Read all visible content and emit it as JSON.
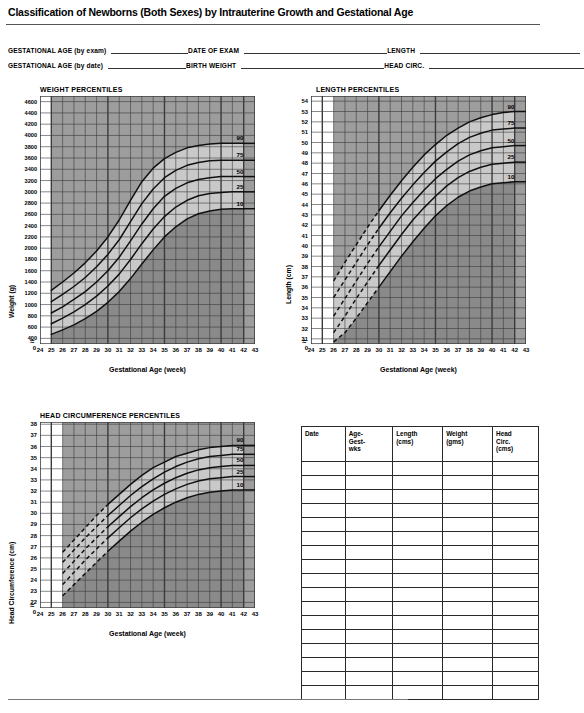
{
  "document": {
    "title": "Classification of Newborns (Both Sexes) by Intrauterine Growth and Gestational Age",
    "footnote": ""
  },
  "fields": [
    {
      "label": "GESTATIONAL AGE (by exam)",
      "value": "",
      "line_width": 78
    },
    {
      "label": "DATE OF EXAM",
      "value": "",
      "line_width": 143
    },
    {
      "label": "LENGTH",
      "value": "",
      "line_width": 160
    },
    {
      "label": "GESTATIONAL AGE (by date)",
      "value": "",
      "line_width": 78
    },
    {
      "label": "BIRTH WEIGHT",
      "value": "",
      "line_width": 143
    },
    {
      "label": "HEAD CIRC.",
      "value": "",
      "line_width": 160
    }
  ],
  "chart_data": [
    {
      "id": "weight",
      "type": "line",
      "title": "WEIGHT PERCENTILES",
      "xlabel": "Gestational Age (week)",
      "ylabel": "Weight (g)",
      "xlim": [
        24,
        43
      ],
      "ylim": [
        300,
        4700
      ],
      "yticks": [
        400,
        600,
        800,
        1000,
        1200,
        1400,
        1600,
        1800,
        2000,
        2200,
        2400,
        2600,
        2800,
        3000,
        3200,
        3400,
        3600,
        3800,
        4000,
        4200,
        4400,
        4600
      ],
      "xticks": [
        24,
        25,
        26,
        27,
        28,
        29,
        30,
        31,
        32,
        33,
        34,
        35,
        36,
        37,
        38,
        39,
        40,
        41,
        42,
        43
      ],
      "axis_break_label": "0",
      "grid": true,
      "x": [
        25,
        26,
        27,
        28,
        29,
        30,
        31,
        32,
        33,
        34,
        35,
        36,
        37,
        38,
        39,
        40,
        41,
        42
      ],
      "series": [
        {
          "name": "90",
          "label": "90",
          "values": [
            1250,
            1400,
            1560,
            1740,
            1950,
            2200,
            2500,
            2850,
            3180,
            3420,
            3590,
            3700,
            3780,
            3820,
            3850,
            3860,
            3860,
            3860
          ]
        },
        {
          "name": "75",
          "label": "75",
          "values": [
            1050,
            1180,
            1320,
            1480,
            1670,
            1890,
            2150,
            2470,
            2790,
            3050,
            3250,
            3380,
            3470,
            3520,
            3550,
            3560,
            3560,
            3560
          ]
        },
        {
          "name": "50",
          "label": "50",
          "values": [
            850,
            960,
            1090,
            1230,
            1400,
            1600,
            1840,
            2130,
            2430,
            2700,
            2920,
            3060,
            3160,
            3220,
            3250,
            3270,
            3270,
            3270
          ]
        },
        {
          "name": "25",
          "label": "25",
          "values": [
            660,
            760,
            870,
            1000,
            1150,
            1330,
            1540,
            1800,
            2080,
            2340,
            2560,
            2730,
            2850,
            2930,
            2970,
            2990,
            3000,
            3000
          ]
        },
        {
          "name": "10",
          "label": "10",
          "values": [
            470,
            550,
            640,
            750,
            880,
            1040,
            1230,
            1460,
            1720,
            1970,
            2200,
            2380,
            2520,
            2610,
            2660,
            2690,
            2700,
            2700
          ]
        }
      ]
    },
    {
      "id": "length",
      "type": "line",
      "title": "LENGTH PERCENTILES",
      "xlabel": "Gestational Age (week)",
      "ylabel": "Length (cm)",
      "xlim": [
        24,
        43
      ],
      "ylim": [
        30.5,
        54.5
      ],
      "yticks": [
        31,
        32,
        33,
        34,
        35,
        36,
        37,
        38,
        39,
        40,
        41,
        42,
        43,
        44,
        45,
        46,
        47,
        48,
        49,
        50,
        51,
        52,
        53,
        54
      ],
      "xticks": [
        24,
        25,
        26,
        27,
        28,
        29,
        30,
        31,
        32,
        33,
        34,
        35,
        36,
        37,
        38,
        39,
        40,
        41,
        42,
        43
      ],
      "axis_break_label": "0",
      "grid": true,
      "x": [
        26,
        27,
        28,
        29,
        30,
        31,
        32,
        33,
        34,
        35,
        36,
        37,
        38,
        39,
        40,
        41,
        42
      ],
      "series": [
        {
          "name": "90",
          "label": "90",
          "values": [
            36.6,
            38.4,
            40.1,
            41.8,
            43.4,
            44.9,
            46.3,
            47.6,
            48.8,
            49.8,
            50.7,
            51.4,
            52.0,
            52.4,
            52.7,
            52.9,
            53.0
          ]
        },
        {
          "name": "75",
          "label": "75",
          "values": [
            35.0,
            36.7,
            38.4,
            40.1,
            41.7,
            43.2,
            44.6,
            45.9,
            47.1,
            48.2,
            49.1,
            49.9,
            50.5,
            50.9,
            51.2,
            51.3,
            51.4
          ]
        },
        {
          "name": "50",
          "label": "50",
          "values": [
            33.2,
            34.9,
            36.6,
            38.3,
            39.9,
            41.4,
            42.9,
            44.2,
            45.4,
            46.5,
            47.4,
            48.2,
            48.8,
            49.2,
            49.5,
            49.6,
            49.7
          ]
        },
        {
          "name": "25",
          "label": "25",
          "values": [
            31.6,
            33.2,
            34.9,
            36.5,
            38.1,
            39.6,
            41.1,
            42.5,
            43.7,
            44.8,
            45.8,
            46.6,
            47.2,
            47.6,
            47.9,
            48.0,
            48.1
          ]
        },
        {
          "name": "10",
          "label": "10",
          "values": [
            30.7,
            31.6,
            33.0,
            34.5,
            36.0,
            37.5,
            39.0,
            40.4,
            41.7,
            42.9,
            43.9,
            44.7,
            45.3,
            45.7,
            46.0,
            46.1,
            46.2
          ]
        }
      ],
      "dashed_start_index": 4
    },
    {
      "id": "head",
      "type": "line",
      "title": "HEAD CIRCUMFERENCE PERCENTILES",
      "xlabel": "Gestational Age (week)",
      "ylabel": "Head Circumference (cm)",
      "xlim": [
        24,
        43
      ],
      "ylim": [
        21.5,
        38.2
      ],
      "yticks": [
        22,
        23,
        24,
        25,
        26,
        27,
        28,
        29,
        30,
        31,
        32,
        33,
        34,
        35,
        36,
        37,
        38
      ],
      "xticks": [
        24,
        25,
        26,
        27,
        28,
        29,
        30,
        31,
        32,
        33,
        34,
        35,
        36,
        37,
        38,
        39,
        40,
        41,
        42,
        43
      ],
      "axis_break_label": "0",
      "grid": true,
      "x": [
        26,
        27,
        28,
        29,
        30,
        31,
        32,
        33,
        34,
        35,
        36,
        37,
        38,
        39,
        40,
        41,
        42
      ],
      "series": [
        {
          "name": "90",
          "label": "90",
          "values": [
            26.5,
            27.6,
            28.7,
            29.8,
            30.8,
            31.7,
            32.6,
            33.4,
            34.1,
            34.6,
            35.1,
            35.4,
            35.7,
            35.9,
            36.0,
            36.1,
            36.1
          ]
        },
        {
          "name": "75",
          "label": "75",
          "values": [
            25.6,
            26.7,
            27.8,
            28.8,
            29.8,
            30.7,
            31.6,
            32.4,
            33.1,
            33.7,
            34.2,
            34.6,
            34.9,
            35.1,
            35.2,
            35.3,
            35.3
          ]
        },
        {
          "name": "50",
          "label": "50",
          "values": [
            24.6,
            25.7,
            26.8,
            27.8,
            28.8,
            29.7,
            30.6,
            31.4,
            32.1,
            32.7,
            33.2,
            33.6,
            33.9,
            34.1,
            34.2,
            34.3,
            34.3
          ]
        },
        {
          "name": "25",
          "label": "25",
          "values": [
            23.6,
            24.7,
            25.8,
            26.8,
            27.8,
            28.7,
            29.6,
            30.4,
            31.1,
            31.7,
            32.2,
            32.6,
            32.9,
            33.1,
            33.2,
            33.3,
            33.3
          ]
        },
        {
          "name": "10",
          "label": "10",
          "values": [
            22.6,
            23.6,
            24.6,
            25.6,
            26.6,
            27.5,
            28.4,
            29.2,
            29.9,
            30.5,
            31.0,
            31.4,
            31.7,
            31.9,
            32.0,
            32.1,
            32.1
          ]
        }
      ],
      "dashed_start_index": 4
    }
  ],
  "percentile_labels": [
    "90",
    "75",
    "50",
    "25",
    "10"
  ],
  "table": {
    "headers": [
      "Date",
      "Age-\nGest-\nwks",
      "Length\n(cms)",
      "Weight\n(gms)",
      "Head\nCirc.\n(cms)"
    ],
    "header_lines": [
      [
        "Date"
      ],
      [
        "Age-",
        "Gest-",
        "wks"
      ],
      [
        "Length",
        "(cms)"
      ],
      [
        "Weight",
        "(gms)"
      ],
      [
        "Head",
        "Circ.",
        "(cms)"
      ]
    ],
    "rows": 17,
    "row_values": []
  },
  "colors": {
    "band_above_90": "#9d9d9d",
    "band_mid": "#c9c9c9",
    "band_below_10": "#8a8a8a",
    "grid": "#3b3b3b",
    "curve": "#111111",
    "outside": "#ffffff"
  }
}
